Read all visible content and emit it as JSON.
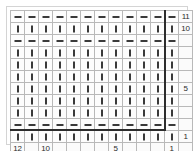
{
  "chart_data": {
    "type": "table",
    "columns": 12,
    "rows": 11,
    "symbols": {
      "purl": "—",
      "knit": "|"
    },
    "legend": [
      {
        "symbol": "—",
        "name": "purl-stitch"
      },
      {
        "symbol": "|",
        "name": "knit-stitch"
      }
    ],
    "row_order": "bottom-to-top",
    "column_order": "right-to-left",
    "grid": [
      [
        "purl",
        "purl",
        "purl",
        "purl",
        "purl",
        "purl",
        "purl",
        "purl",
        "purl",
        "purl",
        "purl",
        "purl"
      ],
      [
        "knit",
        "knit",
        "knit",
        "knit",
        "knit",
        "knit",
        "knit",
        "knit",
        "knit",
        "knit",
        "knit",
        "knit"
      ],
      [
        "purl",
        "purl",
        "purl",
        "purl",
        "purl",
        "purl",
        "purl",
        "purl",
        "purl",
        "purl",
        "purl",
        "purl"
      ],
      [
        "knit",
        "knit",
        "knit",
        "knit",
        "knit",
        "knit",
        "knit",
        "knit",
        "knit",
        "knit",
        "knit",
        "knit"
      ],
      [
        "knit",
        "knit",
        "knit",
        "knit",
        "knit",
        "knit",
        "knit",
        "knit",
        "knit",
        "knit",
        "knit",
        "knit"
      ],
      [
        "knit",
        "knit",
        "knit",
        "knit",
        "knit",
        "knit",
        "knit",
        "knit",
        "knit",
        "knit",
        "knit",
        "knit"
      ],
      [
        "knit",
        "knit",
        "knit",
        "knit",
        "knit",
        "knit",
        "knit",
        "knit",
        "knit",
        "knit",
        "knit",
        "knit"
      ],
      [
        "knit",
        "knit",
        "knit",
        "knit",
        "knit",
        "knit",
        "knit",
        "knit",
        "knit",
        "knit",
        "knit",
        "knit"
      ],
      [
        "knit",
        "knit",
        "knit",
        "knit",
        "knit",
        "knit",
        "knit",
        "knit",
        "knit",
        "knit",
        "knit",
        "knit"
      ],
      [
        "purl",
        "purl",
        "purl",
        "purl",
        "purl",
        "purl",
        "purl",
        "purl",
        "purl",
        "purl",
        "purl",
        "purl"
      ],
      [
        "knit",
        "knit",
        "knit",
        "knit",
        "knit",
        "knit",
        "knit",
        "knit",
        "knit",
        "knit",
        "knit",
        "knit"
      ]
    ],
    "row_labels": [
      "11",
      "10",
      "",
      "",
      "",
      "",
      "5",
      "",
      "",
      "",
      "1"
    ],
    "column_labels": [
      "12",
      "",
      "10",
      "",
      "",
      "",
      "",
      "5",
      "",
      "",
      "",
      "1"
    ],
    "colors": {
      "grid_line": "#b9b9b9",
      "repeat_outline": "#2d2d2d",
      "symbol": "#3a3a3a",
      "background": "#ffffff"
    }
  }
}
